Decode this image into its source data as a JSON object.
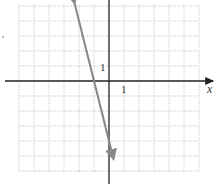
{
  "chart_data": {
    "type": "line",
    "title": "",
    "xlabel": "x",
    "ylabel": "",
    "xlim": [
      -6,
      6
    ],
    "ylim": [
      -6,
      5
    ],
    "grid": true,
    "tick_labels": {
      "x": [
        "1"
      ],
      "y": [
        "1"
      ]
    },
    "series": [
      {
        "name": "line",
        "equation": "y = -4x - 4",
        "slope": -4,
        "intercept": -4,
        "x": [
          -2.3,
          -1,
          0,
          0.3
        ],
        "y": [
          5.2,
          0,
          -4,
          -5.2
        ],
        "color": "#888888",
        "arrows": "both"
      }
    ]
  }
}
